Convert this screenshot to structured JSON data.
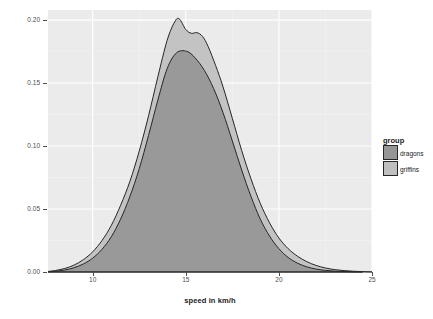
{
  "chart_data": {
    "type": "area",
    "title": "",
    "subtitle": "",
    "xlabel": "speed in km/h",
    "ylabel": "probability",
    "xlim": [
      7.6,
      25.0
    ],
    "ylim": [
      0.0,
      0.208
    ],
    "xticks": [
      10,
      15,
      20,
      25
    ],
    "xtick_labels": [
      "10",
      "15",
      "20",
      "25"
    ],
    "yticks": [
      0.0,
      0.05,
      0.1,
      0.15,
      0.2
    ],
    "ytick_labels": [
      "0.00",
      "0.05",
      "0.10",
      "0.15",
      "0.20"
    ],
    "grid": true,
    "grid_major_color": "#ffffff",
    "panel_background": "#ebebeb",
    "legend_position": "right",
    "legend_title": "group",
    "series": [
      {
        "name": "griffins",
        "fill": "#bfbfbf",
        "line": "#262626",
        "peak_x": 14.65,
        "peak_y": 0.201,
        "x": [
          7.6,
          8.0,
          8.5,
          9.0,
          9.5,
          10.0,
          10.5,
          11.0,
          11.5,
          12.0,
          12.5,
          13.0,
          13.5,
          14.0,
          14.4,
          14.65,
          15.0,
          15.3,
          15.6,
          15.9,
          16.2,
          16.6,
          17.0,
          17.5,
          18.0,
          18.5,
          19.0,
          19.5,
          20.0,
          20.5,
          21.0,
          21.5,
          22.0,
          22.5,
          23.0,
          23.5,
          24.0,
          24.5,
          25.0
        ],
        "y": [
          0.0004,
          0.0012,
          0.0028,
          0.0055,
          0.0098,
          0.016,
          0.025,
          0.037,
          0.053,
          0.072,
          0.096,
          0.124,
          0.155,
          0.184,
          0.1985,
          0.201,
          0.1925,
          0.1895,
          0.19,
          0.187,
          0.179,
          0.164,
          0.147,
          0.122,
          0.0965,
          0.074,
          0.0545,
          0.039,
          0.027,
          0.0185,
          0.0125,
          0.0082,
          0.0052,
          0.0032,
          0.0019,
          0.0011,
          0.0006,
          0.0003,
          0.0001
        ]
      },
      {
        "name": "dragons",
        "fill": "#969696",
        "line": "#262626",
        "peak_x": 15.05,
        "peak_y": 0.175,
        "x": [
          7.6,
          8.0,
          8.5,
          9.0,
          9.5,
          10.0,
          10.5,
          11.0,
          11.5,
          12.0,
          12.5,
          13.0,
          13.5,
          14.0,
          14.5,
          15.05,
          15.5,
          16.0,
          16.5,
          17.0,
          17.5,
          18.0,
          18.5,
          19.0,
          19.5,
          20.0,
          20.5,
          21.0,
          21.5,
          22.0,
          22.5,
          23.0,
          23.5,
          24.0,
          24.5,
          25.0
        ],
        "y": [
          0.0002,
          0.0006,
          0.0016,
          0.0034,
          0.0064,
          0.011,
          0.018,
          0.028,
          0.042,
          0.06,
          0.082,
          0.1085,
          0.1365,
          0.1615,
          0.174,
          0.1752,
          0.17,
          0.16,
          0.1455,
          0.1265,
          0.104,
          0.081,
          0.06,
          0.042,
          0.0285,
          0.0185,
          0.0115,
          0.007,
          0.0041,
          0.0023,
          0.0013,
          0.0007,
          0.0004,
          0.0002,
          0.0001,
          0.0
        ]
      }
    ]
  },
  "legend": {
    "title": "group",
    "items": [
      {
        "label": "dragons",
        "color": "#969696"
      },
      {
        "label": "griffins",
        "color": "#bfbfbf"
      }
    ]
  },
  "axes": {
    "x_title": "speed in km/h",
    "y_title": "probability"
  }
}
